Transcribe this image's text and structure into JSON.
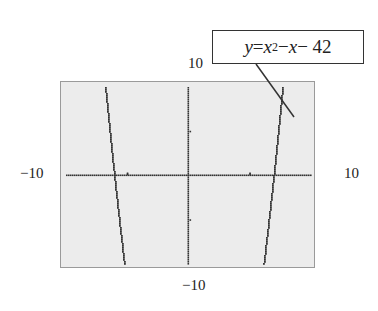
{
  "chart_data": {
    "type": "line",
    "title": "",
    "equation_label": "y = x^2 - x - 42",
    "series": [
      {
        "name": "y = x^2 - x - 42",
        "x": [
          -10,
          -9,
          -8,
          -7,
          -6,
          -5,
          -4,
          -3,
          -2,
          -1,
          0,
          1,
          2,
          3,
          4,
          5,
          6,
          7,
          8,
          9,
          10
        ],
        "values": [
          68,
          48,
          30,
          14,
          0,
          -12,
          -22,
          -30,
          -36,
          -40,
          -42,
          -42,
          -40,
          -36,
          -30,
          -22,
          -12,
          0,
          14,
          30,
          48
        ]
      }
    ],
    "xlim": [
      -10,
      10
    ],
    "ylim": [
      -10,
      10
    ],
    "xscale": 1,
    "yscale": 1,
    "x_intercepts": [
      -6,
      7
    ],
    "window_labels": {
      "xmin": "−10",
      "xmax": "10",
      "ymin": "−10",
      "ymax": "10"
    },
    "grid": false,
    "xlabel": "",
    "ylabel": ""
  },
  "labels": {
    "xmin": "−10",
    "xmax": "10",
    "ymin": "−10",
    "ymax": "10",
    "eq_y": "y",
    "eq_eq": " = ",
    "eq_x": "x",
    "eq_exp": "2",
    "eq_rest_minus1": " − ",
    "eq_x2": "x",
    "eq_rest": " − 42"
  },
  "colors": {
    "screen_bg": "#ececec",
    "pixel": "#333333",
    "frame": "#9a9a9a"
  }
}
